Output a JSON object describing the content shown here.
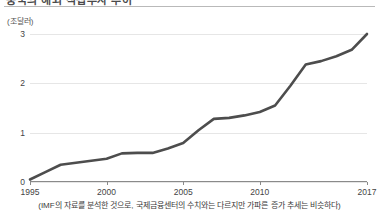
{
  "header": {
    "title_cropped": "중국의 해외 직접투자 추이",
    "divider": true
  },
  "chart_data": {
    "type": "line",
    "title": "",
    "unit_label": "(조달러)",
    "xlabel": "",
    "ylabel": "",
    "xlim": [
      1995,
      2017
    ],
    "ylim": [
      0,
      3
    ],
    "grid": true,
    "legend": "none",
    "line_color": "#4d4d4d",
    "grid_color": "#e6e6e6",
    "axis_color": "#8a8a8a",
    "x_tick_labels": [
      "1995",
      "2000",
      "2005",
      "2010",
      "2017"
    ],
    "x_tick_values": [
      1995,
      2000,
      2005,
      2010,
      2017
    ],
    "y_tick_labels": [
      "0",
      "1",
      "2",
      "3"
    ],
    "y_tick_values": [
      0,
      1,
      2,
      3
    ],
    "x": [
      1995,
      1996,
      1997,
      1998,
      1999,
      2000,
      2001,
      2002,
      2003,
      2004,
      2005,
      2006,
      2007,
      2008,
      2009,
      2010,
      2011,
      2012,
      2013,
      2014,
      2015,
      2016,
      2017
    ],
    "values": [
      0.05,
      0.2,
      0.35,
      0.39,
      0.43,
      0.47,
      0.58,
      0.59,
      0.59,
      0.68,
      0.79,
      1.05,
      1.28,
      1.3,
      1.35,
      1.42,
      1.55,
      1.95,
      2.38,
      2.45,
      2.55,
      2.68,
      3.0
    ]
  },
  "caption": {
    "text": "(IMF의 자료를 분석한 것으로, 국제금융센터의 수치와는 다르지만 가파른 증가 추세는 비슷하다)"
  }
}
